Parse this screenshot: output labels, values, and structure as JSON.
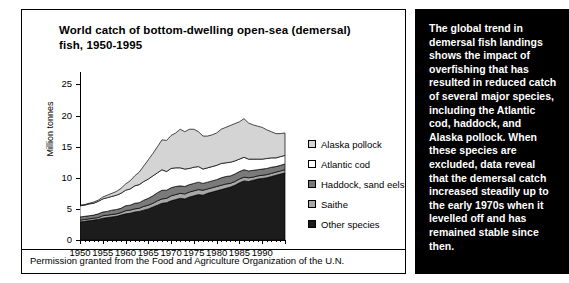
{
  "chart_card": {
    "title": "World catch of bottom-dwelling open-sea (demersal) fish, 1950-1995",
    "footer": "Permission granted from the Food and Agriculture Organization of the U.N."
  },
  "side_panel": {
    "text": "The global trend in demersal fish landings shows the impact of overfishing that has resulted in reduced catch of several major species, including the Atlantic cod, haddock, and Alaska pollock. When these species are excluded, data reveal that the demersal catch increased steadily up to the early 1970s when it levelled off and has remained stable since then."
  },
  "colors": {
    "alaska_pollock": "#d4d4d4",
    "atlantic_cod": "#ffffff",
    "haddock_sand_eels": "#7a7a7a",
    "saithe": "#a8a8a8",
    "other_species": "#1c1c1c",
    "outline": "#000000",
    "panel_background": "#000000",
    "panel_text": "#ffffff",
    "card_background": "#ffffff"
  },
  "chart_data": {
    "type": "area",
    "stacked": true,
    "title": "World catch of bottom-dwelling open-sea (demersal) fish, 1950-1995",
    "xlabel": "",
    "ylabel": "Million tonnes",
    "xlim": [
      1950,
      1995
    ],
    "ylim": [
      0,
      27
    ],
    "yticks": [
      0,
      5,
      10,
      15,
      20,
      25
    ],
    "xticks": [
      1950,
      1955,
      1960,
      1965,
      1970,
      1975,
      1980,
      1985,
      1990
    ],
    "grid": false,
    "legend_position": "right",
    "x": [
      1950,
      1951,
      1952,
      1953,
      1954,
      1955,
      1956,
      1957,
      1958,
      1959,
      1960,
      1961,
      1962,
      1963,
      1964,
      1965,
      1966,
      1967,
      1968,
      1969,
      1970,
      1971,
      1972,
      1973,
      1974,
      1975,
      1976,
      1977,
      1978,
      1979,
      1980,
      1981,
      1982,
      1983,
      1984,
      1985,
      1986,
      1987,
      1988,
      1989,
      1990,
      1991,
      1992,
      1993,
      1994,
      1995
    ],
    "series": [
      {
        "name": "Other species",
        "color": "#1c1c1c",
        "values": [
          2.9,
          3.0,
          3.1,
          3.2,
          3.3,
          3.5,
          3.6,
          3.7,
          3.8,
          4.0,
          4.2,
          4.3,
          4.5,
          4.6,
          4.8,
          5.0,
          5.3,
          5.6,
          5.9,
          6.0,
          6.3,
          6.5,
          6.7,
          6.6,
          6.9,
          7.1,
          7.3,
          7.2,
          7.5,
          7.7,
          7.9,
          8.1,
          8.3,
          8.5,
          8.8,
          9.2,
          9.5,
          9.4,
          9.6,
          9.8,
          9.9,
          10.0,
          10.2,
          10.4,
          10.6,
          10.8
        ]
      },
      {
        "name": "Saithe",
        "color": "#a8a8a8",
        "values": [
          0.3,
          0.3,
          0.3,
          0.3,
          0.3,
          0.4,
          0.4,
          0.4,
          0.4,
          0.4,
          0.5,
          0.5,
          0.5,
          0.5,
          0.6,
          0.6,
          0.6,
          0.7,
          0.7,
          0.7,
          0.8,
          0.8,
          0.8,
          0.8,
          0.8,
          0.8,
          0.8,
          0.8,
          0.7,
          0.7,
          0.7,
          0.7,
          0.7,
          0.6,
          0.6,
          0.6,
          0.6,
          0.6,
          0.5,
          0.5,
          0.5,
          0.5,
          0.5,
          0.5,
          0.5,
          0.5
        ]
      },
      {
        "name": "Haddock, sand eels",
        "color": "#7a7a7a",
        "values": [
          0.5,
          0.5,
          0.5,
          0.5,
          0.6,
          0.6,
          0.6,
          0.7,
          0.7,
          0.7,
          0.8,
          0.8,
          0.9,
          0.9,
          1.0,
          1.1,
          1.2,
          1.3,
          1.4,
          1.3,
          1.3,
          1.3,
          1.2,
          1.2,
          1.2,
          1.2,
          1.2,
          1.1,
          1.1,
          1.1,
          1.1,
          1.2,
          1.2,
          1.2,
          1.2,
          1.2,
          1.2,
          1.1,
          1.1,
          1.0,
          1.0,
          1.0,
          1.0,
          0.9,
          0.9,
          0.9
        ]
      },
      {
        "name": "Atlantic cod",
        "color": "#ffffff",
        "values": [
          1.8,
          1.8,
          1.9,
          1.9,
          2.0,
          2.1,
          2.2,
          2.2,
          2.3,
          2.4,
          2.5,
          2.6,
          2.8,
          2.9,
          3.0,
          3.1,
          3.2,
          3.2,
          3.3,
          3.0,
          3.1,
          3.0,
          2.9,
          2.8,
          2.6,
          2.6,
          2.5,
          2.3,
          2.3,
          2.3,
          2.3,
          2.3,
          2.2,
          2.2,
          2.1,
          2.0,
          2.0,
          1.9,
          1.8,
          1.7,
          1.6,
          1.6,
          1.5,
          1.4,
          1.4,
          1.4
        ]
      },
      {
        "name": "Alaska pollock",
        "color": "#d4d4d4",
        "values": [
          0.1,
          0.1,
          0.1,
          0.2,
          0.2,
          0.3,
          0.4,
          0.5,
          0.6,
          0.8,
          1.0,
          1.3,
          1.6,
          2.0,
          2.5,
          3.1,
          3.6,
          4.2,
          4.8,
          5.0,
          5.3,
          5.6,
          6.2,
          6.0,
          6.3,
          6.1,
          5.6,
          5.3,
          5.1,
          5.1,
          5.2,
          5.5,
          5.7,
          5.9,
          6.0,
          6.0,
          6.2,
          5.8,
          5.5,
          5.3,
          5.1,
          4.6,
          4.2,
          3.9,
          3.7,
          3.6
        ]
      }
    ],
    "totals": [
      5.6,
      5.7,
      5.9,
      6.1,
      6.4,
      6.9,
      7.2,
      7.5,
      7.8,
      8.3,
      9.0,
      9.5,
      10.3,
      10.9,
      11.9,
      12.9,
      13.9,
      15.0,
      16.1,
      16.0,
      16.8,
      17.2,
      17.8,
      17.4,
      17.8,
      17.8,
      17.4,
      16.7,
      16.7,
      16.9,
      17.2,
      17.8,
      18.1,
      18.4,
      18.7,
      19.0,
      19.5,
      18.8,
      18.5,
      18.3,
      18.1,
      17.7,
      17.4,
      17.1,
      17.1,
      17.2
    ],
    "peak": {
      "year": 1986,
      "value": 19.5
    },
    "legend": [
      "Alaska pollock",
      "Atlantic cod",
      "Haddock, sand eels",
      "Saithe",
      "Other species"
    ]
  },
  "axes": {
    "y_title": "Million tonnes",
    "y_ticks": [
      "25",
      "20",
      "15",
      "10",
      "5",
      "0"
    ],
    "x_ticks": [
      "1950",
      "1955",
      "1960",
      "1965",
      "1970",
      "1975",
      "1980",
      "1985",
      "1990"
    ]
  },
  "legend_items": [
    {
      "label": "Alaska pollock",
      "color": "#d4d4d4"
    },
    {
      "label": "Atlantic cod",
      "color": "#ffffff"
    },
    {
      "label": "Haddock, sand eels",
      "color": "#7a7a7a"
    },
    {
      "label": "Saithe",
      "color": "#a8a8a8"
    },
    {
      "label": "Other species",
      "color": "#1c1c1c"
    }
  ]
}
